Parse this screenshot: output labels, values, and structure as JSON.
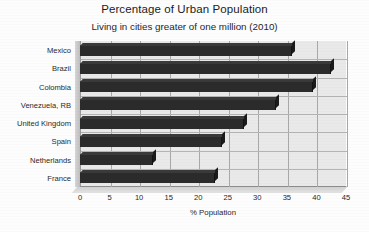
{
  "chart_data": {
    "type": "bar",
    "orientation": "horizontal",
    "title": "Percentage of Urban Population",
    "subtitle": "Living in cities greater of one million (2010)",
    "xlabel": "% Population",
    "ylabel": "",
    "xlim": [
      0,
      45
    ],
    "xticks": [
      0,
      5,
      10,
      15,
      20,
      25,
      30,
      35,
      40,
      45
    ],
    "xtick_labels": [
      "0",
      "5",
      "10",
      "15",
      "20",
      "25",
      "30",
      "35",
      "40",
      "45"
    ],
    "grid": true,
    "legend": false,
    "bar_color": "#2b2b2b",
    "plot_background": "#e9e9e9",
    "categories": [
      "Mexico",
      "Brazil",
      "Colombia",
      "Venezuela, RB",
      "United Kingdom",
      "Spain",
      "Netherlands",
      "France"
    ],
    "values": [
      35.8,
      42.4,
      39.4,
      33.1,
      27.7,
      24.1,
      12.4,
      22.9
    ]
  }
}
